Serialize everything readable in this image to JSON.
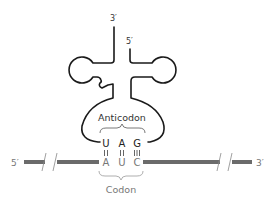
{
  "diagram": {
    "trna": {
      "end_3_label": "3′",
      "end_5_label": "5′",
      "anticodon_label": "Anticodon",
      "anticodon_bases": [
        "U",
        "A",
        "G"
      ]
    },
    "mrna": {
      "end_5_label": "5′",
      "end_3_label": "3′",
      "codon_label": "Codon",
      "codon_bases": [
        "A",
        "U",
        "C"
      ]
    },
    "base_pairs": [
      {
        "top": "U",
        "bottom": "A",
        "bonds": 2
      },
      {
        "top": "A",
        "bottom": "U",
        "bonds": 2
      },
      {
        "top": "G",
        "bottom": "C",
        "bonds": 3
      }
    ],
    "colors": {
      "trna_outline": "#1a1a1a",
      "mrna_strand": "#6b6b6b",
      "label_dark": "#333333",
      "label_gray": "#777777"
    }
  }
}
